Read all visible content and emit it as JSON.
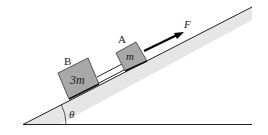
{
  "diagram": {
    "type": "inclined-plane-physics",
    "incline_angle_label": "θ",
    "blocks": [
      {
        "id": "B",
        "label": "B",
        "mass_label": "3m"
      },
      {
        "id": "A",
        "label": "A",
        "mass_label": "m"
      }
    ],
    "force": {
      "label": "F",
      "direction": "up the incline"
    },
    "colors": {
      "incline_fill": "#e6e6e6",
      "block_fill": "#a8a8a8",
      "line": "#111111",
      "arrow": "#000000"
    }
  }
}
